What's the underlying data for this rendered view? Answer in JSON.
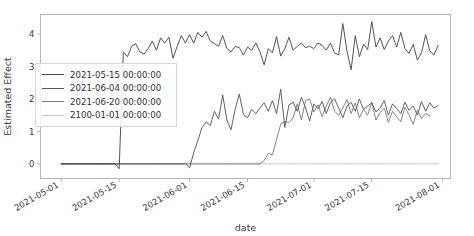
{
  "chart_data": {
    "type": "line",
    "title": "",
    "xlabel": "date",
    "ylabel": "Estimated Effect",
    "grid": false,
    "legend_position": "center-left",
    "xlim": [
      "2021-04-26",
      "2021-08-03"
    ],
    "ylim": [
      -0.45,
      4.6
    ],
    "yticks": [
      0,
      1,
      2,
      3,
      4
    ],
    "ytick_labels": [
      "0",
      "1",
      "2",
      "3",
      "4"
    ],
    "xticks": [
      "2021-05-01",
      "2021-05-15",
      "2021-06-01",
      "2021-06-15",
      "2021-07-01",
      "2021-07-15",
      "2021-08-01"
    ],
    "xtick_labels": [
      "2021-05-01",
      "2021-05-15",
      "2021-06-01",
      "2021-06-15",
      "2021-07-01",
      "2021-07-15",
      "2021-08-01"
    ],
    "series": [
      {
        "name": "2021-05-15 00:00:00",
        "color": "#4a4a4a",
        "intervention_date": "2021-05-15",
        "x_start": "2021-05-01",
        "values": [
          0,
          0,
          0,
          0,
          0,
          0,
          0,
          0,
          0,
          0,
          0,
          0,
          0,
          0,
          -0.15,
          3.45,
          3.3,
          3.62,
          3.7,
          3.45,
          3.38,
          3.55,
          3.78,
          3.5,
          3.88,
          3.72,
          3.9,
          3.25,
          3.62,
          3.95,
          3.72,
          3.98,
          3.72,
          4.05,
          3.9,
          4.08,
          3.78,
          3.7,
          3.62,
          3.95,
          3.55,
          3.45,
          3.62,
          3.58,
          3.35,
          3.6,
          3.5,
          3.72,
          3.45,
          3.05,
          3.55,
          3.42,
          3.92,
          3.32,
          3.55,
          3.9,
          3.5,
          3.62,
          3.72,
          3.58,
          3.62,
          3.55,
          3.72,
          3.65,
          3.5,
          3.72,
          3.42,
          3.35,
          4.32,
          3.48,
          2.9,
          3.95,
          3.3,
          3.68,
          3.52,
          4.38,
          3.6,
          3.88,
          3.52,
          3.78,
          3.95,
          3.6,
          4.05,
          3.55,
          3.4,
          3.68,
          3.2,
          3.42,
          3.98,
          3.48,
          3.35,
          3.65
        ]
      },
      {
        "name": "2021-06-04 00:00:00",
        "color": "#5a5a5a",
        "intervention_date": "2021-06-04",
        "x_start": "2021-05-01",
        "values": [
          0,
          0,
          0,
          0,
          0,
          0,
          0,
          0,
          0,
          0,
          0,
          0,
          0,
          0,
          0,
          0,
          0,
          0,
          0,
          0,
          0,
          0,
          0,
          0,
          0,
          0,
          0,
          0,
          0,
          0,
          0,
          -0.12,
          0.35,
          0.72,
          1.12,
          1.3,
          1.18,
          1.62,
          1.38,
          2.12,
          1.35,
          1.05,
          1.68,
          2.15,
          1.52,
          1.42,
          1.68,
          1.55,
          1.72,
          1.88,
          1.62,
          1.95,
          1.55,
          2.3,
          1.12,
          1.82,
          1.9,
          1.62,
          2.05,
          1.72,
          1.32,
          1.85,
          1.7,
          1.92,
          1.55,
          1.88,
          2.0,
          1.72,
          1.42,
          1.78,
          1.9,
          1.62,
          2.0,
          1.68,
          1.78,
          1.88,
          1.6,
          1.72,
          1.95,
          1.5,
          1.85,
          1.7,
          1.55,
          1.9,
          1.65,
          1.78,
          1.5,
          1.92,
          1.62,
          1.88,
          1.72,
          1.8
        ]
      },
      {
        "name": "2021-06-20 00:00:00",
        "color": "#7d7d7d",
        "intervention_date": "2021-06-20",
        "x_start": "2021-05-01",
        "values": [
          0,
          0,
          0,
          0,
          0,
          0,
          0,
          0,
          0,
          0,
          0,
          0,
          0,
          0,
          0,
          0,
          0,
          0,
          0,
          0,
          0,
          0,
          0,
          0,
          0,
          0,
          0,
          0,
          0,
          0,
          0,
          0,
          0,
          0,
          0,
          0,
          0,
          0,
          0,
          0,
          0,
          0,
          0,
          0,
          0,
          0,
          0,
          0,
          0,
          0.1,
          0.32,
          0.28,
          0.75,
          1.22,
          1.3,
          1.28,
          1.42,
          1.85,
          1.35,
          1.95,
          2.0,
          1.6,
          1.82,
          1.45,
          1.78,
          2.05,
          1.62,
          1.5,
          1.72,
          1.98,
          1.55,
          1.88,
          1.42,
          1.68,
          1.5,
          1.9,
          1.35,
          1.58,
          1.72,
          1.28,
          1.62,
          1.45,
          1.3,
          1.75,
          1.5,
          1.22,
          1.65,
          1.4,
          1.55,
          1.48
        ]
      },
      {
        "name": "2100-01-01 00:00:00",
        "color": "#c9c9c9",
        "intervention_date": "2100-01-01",
        "x_start": "2021-05-01",
        "values": [
          0,
          0,
          0,
          0,
          0,
          0,
          0,
          0,
          0,
          0,
          0,
          0,
          0,
          0,
          0,
          0,
          0,
          0,
          0,
          0,
          0,
          0,
          0,
          0,
          0,
          0,
          0,
          0,
          0,
          0,
          0,
          0,
          0,
          0,
          0,
          0,
          0,
          0,
          0,
          0,
          0,
          0,
          0,
          0,
          0,
          0,
          0,
          0,
          0,
          0,
          0,
          0,
          0,
          0,
          0,
          0,
          0,
          0,
          0,
          0,
          0,
          0,
          0,
          0,
          0,
          0,
          0,
          0,
          0,
          0,
          0,
          0,
          0,
          0,
          0,
          0,
          0,
          0,
          0,
          0,
          0,
          0,
          0,
          0,
          0,
          0,
          0,
          0,
          0,
          0,
          0,
          0
        ]
      }
    ]
  },
  "legend": {
    "entries": [
      {
        "label": "2021-05-15 00:00:00"
      },
      {
        "label": "2021-06-04 00:00:00"
      },
      {
        "label": "2021-06-20 00:00:00"
      },
      {
        "label": "2100-01-01 00:00:00"
      }
    ]
  },
  "axes": {
    "x_title": "date",
    "y_title": "Estimated Effect"
  }
}
